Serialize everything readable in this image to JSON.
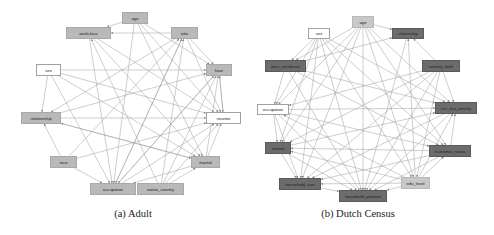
{
  "figures": [
    {
      "id": "adult",
      "caption": "(a) Adult",
      "caption_pos": [
        133,
        208
      ],
      "nodes": [
        {
          "key": "age",
          "label": "age",
          "style": "gray",
          "x": 122,
          "y": 12,
          "w": 26,
          "h": 12
        },
        {
          "key": "workclass",
          "label": "workclass",
          "style": "gray",
          "x": 66,
          "y": 27,
          "w": 45,
          "h": 12
        },
        {
          "key": "edu",
          "label": "edu",
          "style": "gray",
          "x": 171,
          "y": 27,
          "w": 27,
          "h": 12
        },
        {
          "key": "sex",
          "label": "sex",
          "style": "white",
          "x": 36,
          "y": 64,
          "w": 25,
          "h": 12
        },
        {
          "key": "hour",
          "label": "hour",
          "style": "gray",
          "x": 206,
          "y": 64,
          "w": 26,
          "h": 12
        },
        {
          "key": "relationship",
          "label": "relationship",
          "style": "gray",
          "x": 21,
          "y": 112,
          "w": 40,
          "h": 12
        },
        {
          "key": "income",
          "label": "income",
          "style": "white",
          "x": 206,
          "y": 112,
          "w": 35,
          "h": 12
        },
        {
          "key": "race",
          "label": "race",
          "style": "gray",
          "x": 50,
          "y": 156,
          "w": 27,
          "h": 12
        },
        {
          "key": "marital",
          "label": "marital",
          "style": "gray",
          "x": 191,
          "y": 156,
          "w": 29,
          "h": 12
        },
        {
          "key": "occupation",
          "label": "occupation",
          "style": "gray",
          "x": 90,
          "y": 183,
          "w": 46,
          "h": 12
        },
        {
          "key": "native_country",
          "label": "native_country",
          "style": "gray",
          "x": 137,
          "y": 183,
          "w": 47,
          "h": 12
        }
      ],
      "edges": [
        [
          "age",
          "workclass"
        ],
        [
          "edu",
          "workclass"
        ],
        [
          "age",
          "hour"
        ],
        [
          "edu",
          "hour"
        ],
        [
          "sex",
          "hour"
        ],
        [
          "age",
          "income"
        ],
        [
          "edu",
          "income"
        ],
        [
          "hour",
          "income"
        ],
        [
          "sex",
          "income"
        ],
        [
          "relationship",
          "income"
        ],
        [
          "workclass",
          "income"
        ],
        [
          "marital",
          "income"
        ],
        [
          "occupation",
          "income"
        ],
        [
          "race",
          "income"
        ],
        [
          "native_country",
          "income"
        ],
        [
          "sex",
          "relationship"
        ],
        [
          "edu",
          "relationship"
        ],
        [
          "race",
          "relationship"
        ],
        [
          "marital",
          "relationship"
        ],
        [
          "age",
          "occupation"
        ],
        [
          "workclass",
          "occupation"
        ],
        [
          "edu",
          "occupation"
        ],
        [
          "sex",
          "occupation"
        ],
        [
          "hour",
          "occupation"
        ],
        [
          "race",
          "occupation"
        ],
        [
          "marital",
          "occupation"
        ],
        [
          "age",
          "marital"
        ],
        [
          "sex",
          "marital"
        ],
        [
          "workclass",
          "marital"
        ],
        [
          "relationship",
          "marital"
        ],
        [
          "native_country",
          "marital"
        ],
        [
          "native_country",
          "hour"
        ],
        [
          "native_country",
          "edu"
        ],
        [
          "occupation",
          "hour"
        ],
        [
          "occupation",
          "edu"
        ],
        [
          "race",
          "edu"
        ],
        [
          "marital",
          "hour"
        ],
        [
          "native_country",
          "workclass"
        ],
        [
          "relationship",
          "hour"
        ],
        [
          "income",
          "hour"
        ]
      ]
    },
    {
      "id": "dutch_census",
      "caption": "(b) Dutch Census",
      "caption_pos": [
        358,
        208
      ],
      "nodes": [
        {
          "key": "age",
          "label": "age",
          "style": "light",
          "x": 352,
          "y": 16,
          "w": 22,
          "h": 12
        },
        {
          "key": "sex",
          "label": "sex",
          "style": "white",
          "x": 308,
          "y": 28,
          "w": 22,
          "h": 11
        },
        {
          "key": "citizenship",
          "label": "citizenship",
          "style": "dark",
          "x": 392,
          "y": 28,
          "w": 32,
          "h": 11
        },
        {
          "key": "prev_residence",
          "label": "prev_residence",
          "style": "dark",
          "x": 265,
          "y": 60,
          "w": 41,
          "h": 12
        },
        {
          "key": "country_birth",
          "label": "country_birth",
          "style": "dark",
          "x": 422,
          "y": 60,
          "w": 38,
          "h": 12
        },
        {
          "key": "occupation",
          "label": "occupation",
          "style": "white",
          "x": 257,
          "y": 104,
          "w": 32,
          "h": 11
        },
        {
          "key": "cur_eco_activity",
          "label": "cur_eco_activity",
          "style": "dark",
          "x": 435,
          "y": 102,
          "w": 42,
          "h": 12
        },
        {
          "key": "marital",
          "label": "marital",
          "style": "dark",
          "x": 265,
          "y": 142,
          "w": 26,
          "h": 12
        },
        {
          "key": "economic_status",
          "label": "economic_status",
          "style": "dark",
          "x": 429,
          "y": 145,
          "w": 42,
          "h": 12
        },
        {
          "key": "household_size",
          "label": "household_size",
          "style": "dark",
          "x": 279,
          "y": 178,
          "w": 42,
          "h": 12
        },
        {
          "key": "edu_level",
          "label": "edu_level",
          "style": "light",
          "x": 401,
          "y": 177,
          "w": 29,
          "h": 12
        },
        {
          "key": "household_position",
          "label": "household_position",
          "style": "dark",
          "x": 339,
          "y": 190,
          "w": 48,
          "h": 12
        }
      ],
      "edges": [
        [
          "age",
          "household_position"
        ],
        [
          "age",
          "household_size"
        ],
        [
          "age",
          "marital"
        ],
        [
          "age",
          "edu_level"
        ],
        [
          "age",
          "economic_status"
        ],
        [
          "age",
          "cur_eco_activity"
        ],
        [
          "age",
          "citizenship"
        ],
        [
          "age",
          "prev_residence"
        ],
        [
          "age",
          "occupation"
        ],
        [
          "sex",
          "household_position"
        ],
        [
          "sex",
          "cur_eco_activity"
        ],
        [
          "sex",
          "economic_status"
        ],
        [
          "sex",
          "edu_level"
        ],
        [
          "sex",
          "marital"
        ],
        [
          "sex",
          "prev_residence"
        ],
        [
          "sex",
          "occupation"
        ],
        [
          "sex",
          "household_size"
        ],
        [
          "country_birth",
          "citizenship"
        ],
        [
          "country_birth",
          "cur_eco_activity"
        ],
        [
          "country_birth",
          "household_position"
        ],
        [
          "country_birth",
          "household_size"
        ],
        [
          "country_birth",
          "marital"
        ],
        [
          "country_birth",
          "occupation"
        ],
        [
          "country_birth",
          "edu_level"
        ],
        [
          "prev_residence",
          "occupation"
        ],
        [
          "prev_residence",
          "economic_status"
        ],
        [
          "prev_residence",
          "household_position"
        ],
        [
          "prev_residence",
          "cur_eco_activity"
        ],
        [
          "occupation",
          "cur_eco_activity"
        ],
        [
          "occupation",
          "marital"
        ],
        [
          "occupation",
          "household_size"
        ],
        [
          "occupation",
          "economic_status"
        ],
        [
          "occupation",
          "household_position"
        ],
        [
          "edu_level",
          "occupation"
        ],
        [
          "edu_level",
          "marital"
        ],
        [
          "edu_level",
          "household_size"
        ],
        [
          "edu_level",
          "household_position"
        ],
        [
          "edu_level",
          "cur_eco_activity"
        ],
        [
          "edu_level",
          "economic_status"
        ],
        [
          "edu_level",
          "citizenship"
        ],
        [
          "marital",
          "household_size"
        ],
        [
          "marital",
          "household_position"
        ],
        [
          "marital",
          "cur_eco_activity"
        ],
        [
          "economic_status",
          "marital"
        ],
        [
          "economic_status",
          "household_position"
        ],
        [
          "economic_status",
          "household_size"
        ],
        [
          "economic_status",
          "cur_eco_activity"
        ],
        [
          "household_size",
          "household_position"
        ],
        [
          "cur_eco_activity",
          "household_position"
        ],
        [
          "cur_eco_activity",
          "household_size"
        ],
        [
          "citizenship",
          "household_position"
        ],
        [
          "prev_residence",
          "citizenship"
        ]
      ]
    }
  ],
  "colors": {
    "edge": "#9c9c9c",
    "arrow": "#8a8a8a"
  }
}
